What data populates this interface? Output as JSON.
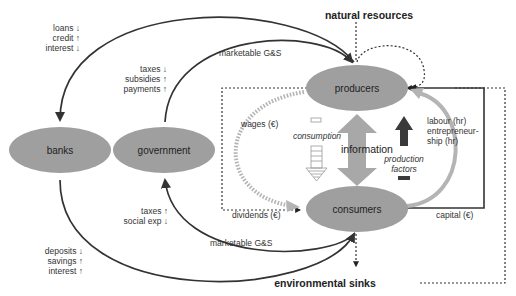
{
  "diagram": {
    "colors": {
      "node_fill": "#9f9f9f",
      "arrow_dark": "#333333",
      "arrow_light": "#b4b4b4",
      "production_factors_arrow": "#3a3a3a",
      "background": "#ffffff"
    },
    "nodes": {
      "producers": "producers",
      "consumers": "consumers",
      "banks": "banks",
      "government": "government"
    },
    "external": {
      "natural_resources": "natural resources",
      "environmental_sinks": "environmental sinks"
    },
    "labels": {
      "banks_top": [
        "loans ↓",
        "credit ↑",
        "interest ↓"
      ],
      "government_top": [
        "taxes ↓",
        "subsidies ↑",
        "payments ↑"
      ],
      "marketable_top": "marketable G&S",
      "government_bottom": [
        "taxes ↑",
        "social exp ↓"
      ],
      "banks_bottom": [
        "deposits ↓",
        "savings ↑",
        "interest ↑"
      ],
      "marketable_bottom": "marketable G&S",
      "wages": "wages (€)",
      "dividends": "dividends (€)",
      "consumption": "consumption",
      "information": "information",
      "production_factors": [
        "production",
        "factors"
      ],
      "labour": [
        "labour (hr)",
        "entrepreneur-",
        "ship (hr)"
      ],
      "capital": "capital (€)"
    }
  }
}
